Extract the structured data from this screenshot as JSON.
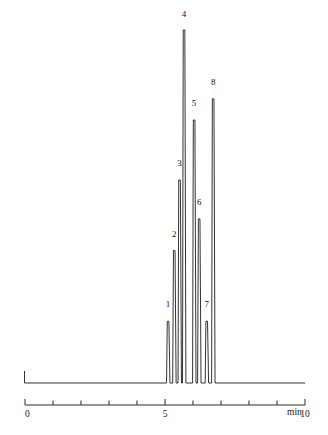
{
  "figure": {
    "background_color": "#ffffff",
    "trace_color": "#1c1c1c",
    "axis_color": "#2a2a2a",
    "text_color": "#1a1a1a"
  },
  "axis": {
    "unit_label": "min",
    "tick_labels": [
      "0",
      "5",
      "10"
    ],
    "tick_label_values": [
      0,
      5,
      10
    ],
    "minor_ticks": [
      1,
      2,
      3,
      4,
      6,
      7,
      8,
      9
    ],
    "x_min": 0,
    "x_max": 10
  },
  "chart_data": {
    "type": "line",
    "title": "",
    "subtitle": "",
    "xlabel": "min",
    "ylabel": "",
    "xlim": [
      0,
      10
    ],
    "ylim": [
      0,
      1
    ],
    "grid": false,
    "legend": "none",
    "annotations": [
      "1",
      "2",
      "3",
      "4",
      "5",
      "6",
      "7",
      "8"
    ],
    "series": [
      {
        "name": "chromatogram",
        "x": [
          5.11,
          5.33,
          5.52,
          5.68,
          6.04,
          6.22,
          6.49,
          6.72,
          6.96,
          7.16
        ],
        "peak_retention_times": [
          5.11,
          5.33,
          5.52,
          5.68,
          6.04,
          6.22,
          6.49,
          6.72
        ],
        "peak_heights_rel": [
          0.175,
          0.375,
          0.575,
          1.0,
          0.745,
          0.465,
          0.175,
          0.805
        ],
        "peak_labels": [
          "1",
          "2",
          "3",
          "4",
          "5",
          "6",
          "7",
          "8"
        ]
      }
    ],
    "peaks": [
      {
        "label": "1",
        "rt": 5.11,
        "height": 0.175,
        "label_x": 5.11,
        "label_y": 0.215
      },
      {
        "label": "2",
        "rt": 5.33,
        "height": 0.375,
        "label_x": 5.33,
        "label_y": 0.415
      },
      {
        "label": "3",
        "rt": 5.52,
        "height": 0.575,
        "label_x": 5.52,
        "label_y": 0.615
      },
      {
        "label": "4",
        "rt": 5.68,
        "height": 1.0,
        "label_x": 5.68,
        "label_y": 1.038
      },
      {
        "label": "5",
        "rt": 6.04,
        "height": 0.745,
        "label_x": 6.04,
        "label_y": 0.785
      },
      {
        "label": "6",
        "rt": 6.22,
        "height": 0.465,
        "label_x": 6.22,
        "label_y": 0.505
      },
      {
        "label": "7",
        "rt": 6.49,
        "height": 0.175,
        "label_x": 6.49,
        "label_y": 0.215
      },
      {
        "label": "8",
        "rt": 6.72,
        "height": 0.805,
        "label_x": 6.72,
        "label_y": 0.845
      }
    ]
  }
}
